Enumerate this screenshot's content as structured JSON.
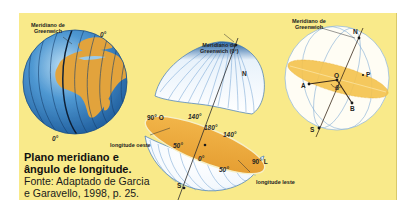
{
  "figure": {
    "caption": {
      "title_line1": "Plano meridiano e",
      "title_line2": "ângulo de longitude.",
      "source_line1": "Fonte: Adaptado de Garcia",
      "source_line2": "e Garavello, 1998, p. 25."
    },
    "globe": {
      "meridian_label_line1": "Meridiano de",
      "meridian_label_line2": "Greenwich",
      "top_degree": "0°",
      "bottom_degree": "0°"
    },
    "split_sphere": {
      "meridian_label_line1": "Meridiano de",
      "meridian_label_line2": "Greenwich (0°)",
      "north": "N",
      "south": "S",
      "west_90": "90° O",
      "east_90": "90° L",
      "deg_140_left": "140°",
      "deg_180": "180°",
      "deg_140_right": "140°",
      "deg_50_left": "50°",
      "deg_0": "0°",
      "deg_50_right": "50°",
      "west_longitude_label": "longitude oeste",
      "east_longitude_label": "longitude leste"
    },
    "geometry_sphere": {
      "meridian_label_line1": "Meridiano de",
      "meridian_label_line2": "Greenwich",
      "north": "N",
      "south": "S",
      "point_a": "A",
      "point_b": "B",
      "point_o": "O",
      "point_p": "P",
      "angle_symbol": "ß"
    },
    "colors": {
      "background": "#f9ea8a",
      "ocean": "#3f86c4",
      "land": "#e2a43c",
      "equator_plane": "#eea53a",
      "sphere_fill": "#ffffff",
      "sphere_line": "#5b93c9"
    }
  }
}
